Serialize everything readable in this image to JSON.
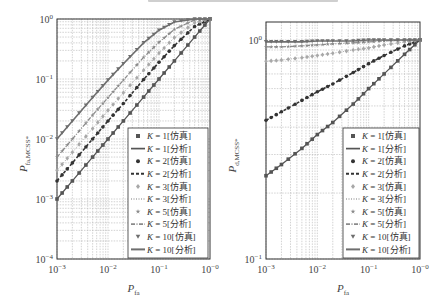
{
  "chart_data": [
    {
      "type": "line",
      "title": "",
      "xlabel": "P_fa",
      "ylabel": "P_fa,MCSS*",
      "xscale": "log",
      "yscale": "log",
      "xlim": [
        0.001,
        1
      ],
      "ylim": [
        0.0001,
        1
      ],
      "xticks": [
        "10^-3",
        "10^-2",
        "10^-1",
        "10^-0"
      ],
      "yticks": [
        "10^-4",
        "10^-3",
        "10^-2",
        "10^-1",
        "10^0"
      ],
      "grid": true,
      "legend_position": "lower right",
      "x": [
        0.001,
        0.002,
        0.005,
        0.01,
        0.02,
        0.05,
        0.1,
        0.2,
        0.5,
        1.0
      ],
      "series": [
        {
          "name": "K=1[仿真]",
          "marker": "square",
          "values": [
            0.001,
            0.002,
            0.005,
            0.01,
            0.02,
            0.05,
            0.1,
            0.2,
            0.5,
            1.0
          ]
        },
        {
          "name": "K=1[分析]",
          "line": "solid",
          "values": [
            0.001,
            0.002,
            0.005,
            0.01,
            0.02,
            0.05,
            0.1,
            0.2,
            0.5,
            1.0
          ]
        },
        {
          "name": "K=2[仿真]",
          "marker": "circle",
          "values": [
            0.002,
            0.004,
            0.01,
            0.02,
            0.039,
            0.098,
            0.19,
            0.36,
            0.75,
            1.0
          ]
        },
        {
          "name": "K=2[分析]",
          "line": "dashed",
          "values": [
            0.002,
            0.004,
            0.01,
            0.02,
            0.039,
            0.098,
            0.19,
            0.36,
            0.75,
            1.0
          ]
        },
        {
          "name": "K=3[仿真]",
          "marker": "diamond",
          "values": [
            0.003,
            0.006,
            0.015,
            0.03,
            0.059,
            0.14,
            0.27,
            0.49,
            0.87,
            1.0
          ]
        },
        {
          "name": "K=3[分析]",
          "line": "dotted",
          "values": [
            0.003,
            0.006,
            0.015,
            0.03,
            0.059,
            0.14,
            0.27,
            0.49,
            0.87,
            1.0
          ]
        },
        {
          "name": "K=5[仿真]",
          "marker": "star",
          "values": [
            0.005,
            0.01,
            0.025,
            0.049,
            0.096,
            0.23,
            0.41,
            0.67,
            0.97,
            1.0
          ]
        },
        {
          "name": "K=5[分析]",
          "line": "dashdot",
          "values": [
            0.005,
            0.01,
            0.025,
            0.049,
            0.096,
            0.23,
            0.41,
            0.67,
            0.97,
            1.0
          ]
        },
        {
          "name": "K=10[仿真]",
          "marker": "triangle-down",
          "values": [
            0.01,
            0.02,
            0.049,
            0.096,
            0.18,
            0.4,
            0.65,
            0.89,
            1.0,
            1.0
          ]
        },
        {
          "name": "K=10[分析]",
          "line": "solid-thick",
          "values": [
            0.01,
            0.02,
            0.049,
            0.096,
            0.18,
            0.4,
            0.65,
            0.89,
            1.0,
            1.0
          ]
        }
      ]
    },
    {
      "type": "line",
      "title": "",
      "xlabel": "P_fa",
      "ylabel": "P_d,MCSS*",
      "xscale": "log",
      "yscale": "log",
      "xlim": [
        0.001,
        1
      ],
      "ylim": [
        0.1,
        1.2
      ],
      "xticks": [
        "10^-3",
        "10^-2",
        "10^-1",
        "10^-0"
      ],
      "yticks": [
        "10^-1",
        "10^0"
      ],
      "grid": true,
      "legend_position": "lower right",
      "x": [
        0.001,
        0.002,
        0.005,
        0.01,
        0.02,
        0.05,
        0.1,
        0.2,
        0.5,
        1.0
      ],
      "series": [
        {
          "name": "K=1[仿真]",
          "marker": "square",
          "values": [
            0.24,
            0.27,
            0.32,
            0.37,
            0.42,
            0.51,
            0.6,
            0.7,
            0.86,
            1.0
          ]
        },
        {
          "name": "K=1[分析]",
          "line": "solid",
          "values": [
            0.24,
            0.27,
            0.32,
            0.37,
            0.42,
            0.51,
            0.6,
            0.7,
            0.86,
            1.0
          ]
        },
        {
          "name": "K=2[仿真]",
          "marker": "circle",
          "values": [
            0.43,
            0.47,
            0.53,
            0.58,
            0.63,
            0.71,
            0.78,
            0.85,
            0.94,
            1.0
          ]
        },
        {
          "name": "K=2[分析]",
          "line": "dashed",
          "values": [
            0.43,
            0.47,
            0.53,
            0.58,
            0.63,
            0.71,
            0.78,
            0.85,
            0.94,
            1.0
          ]
        },
        {
          "name": "K=3[仿真]",
          "marker": "diamond",
          "values": [
            0.8,
            0.81,
            0.83,
            0.85,
            0.87,
            0.9,
            0.92,
            0.95,
            0.98,
            1.0
          ]
        },
        {
          "name": "K=3[分析]",
          "line": "dotted",
          "values": [
            0.8,
            0.81,
            0.83,
            0.85,
            0.87,
            0.9,
            0.92,
            0.95,
            0.98,
            1.0
          ]
        },
        {
          "name": "K=5[仿真]",
          "marker": "star",
          "values": [
            0.93,
            0.93,
            0.94,
            0.95,
            0.96,
            0.97,
            0.98,
            0.99,
            1.0,
            1.0
          ]
        },
        {
          "name": "K=5[分析]",
          "line": "dashdot",
          "values": [
            0.93,
            0.93,
            0.94,
            0.95,
            0.96,
            0.97,
            0.98,
            0.99,
            1.0,
            1.0
          ]
        },
        {
          "name": "K=10[仿真]",
          "marker": "triangle-down",
          "values": [
            0.98,
            0.98,
            0.98,
            0.99,
            0.99,
            0.99,
            1.0,
            1.0,
            1.0,
            1.0
          ]
        },
        {
          "name": "K=10[分析]",
          "line": "solid-thick",
          "values": [
            0.98,
            0.98,
            0.98,
            0.99,
            0.99,
            0.99,
            1.0,
            1.0,
            1.0,
            1.0
          ]
        }
      ]
    }
  ],
  "plots": [
    {
      "ylabel_main": "P",
      "ylabel_sub": "fa,MCSS*",
      "xlabel_main": "P",
      "xlabel_sub": "fa",
      "xtick_labels": [
        "10−3",
        "10−2",
        "10−1",
        "10−0"
      ],
      "ytick_labels": [
        "10−4",
        "10−3",
        "10−2",
        "10−1",
        "100"
      ]
    },
    {
      "ylabel_main": "P",
      "ylabel_sub": "d,MCSS*",
      "xlabel_main": "P",
      "xlabel_sub": "fa",
      "xtick_labels": [
        "10−3",
        "10−2",
        "10−1",
        "10−0"
      ],
      "ytick_labels": [
        "10−1",
        "100"
      ]
    }
  ],
  "legend": [
    {
      "k": "K",
      "rest": " = 1[仿真]"
    },
    {
      "k": "K",
      "rest": " = 1[分析]"
    },
    {
      "k": "K",
      "rest": " = 2[仿真]"
    },
    {
      "k": "K",
      "rest": " = 2[分析]"
    },
    {
      "k": "K",
      "rest": " = 3[仿真]"
    },
    {
      "k": "K",
      "rest": " = 3[分析]"
    },
    {
      "k": "K",
      "rest": " = 5[仿真]"
    },
    {
      "k": "K",
      "rest": " = 5[分析]"
    },
    {
      "k": "K",
      "rest": " = 10[仿真]"
    },
    {
      "k": "K",
      "rest": " = 10[分析]"
    }
  ],
  "colors": {
    "k1": "#555555",
    "k2": "#333333",
    "k3": "#a8a8a8",
    "k5": "#8a8a8a",
    "k10": "#6e6e6e",
    "axis": "#333333",
    "grid": "#b5b5b5"
  }
}
